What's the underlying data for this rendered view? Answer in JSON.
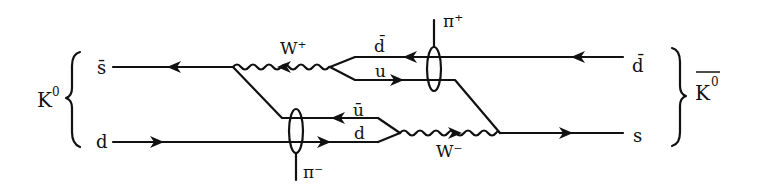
{
  "diagram": {
    "type": "feynman-diagram",
    "colors": {
      "line": "#111111",
      "background": "#ffffff"
    },
    "left_meson": {
      "label": "K",
      "superscript": "0"
    },
    "right_meson": {
      "label": "K",
      "superscript": "0",
      "overbar": true
    },
    "quark_labels": {
      "left_top": "s̄",
      "left_bottom": "d",
      "right_top": "d̄",
      "right_bottom": "s",
      "mid_top_upper": "d̄",
      "mid_top_lower": "u",
      "mid_bottom_upper": "ū",
      "mid_bottom_lower": "d"
    },
    "bosons": {
      "upper": "W⁺",
      "lower": "W⁻"
    },
    "pions": {
      "upper": "π⁺",
      "lower": "π⁻"
    }
  }
}
